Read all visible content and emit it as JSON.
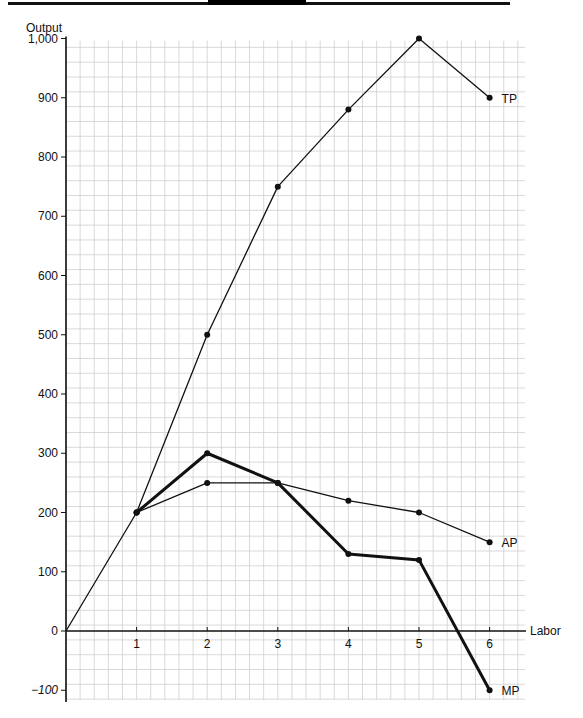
{
  "chart_data": {
    "type": "line",
    "title": "",
    "xlabel": "Labor",
    "ylabel": "Output",
    "x": [
      0,
      1,
      2,
      3,
      4,
      5,
      6
    ],
    "x_ticks": [
      "1",
      "2",
      "3",
      "4",
      "5",
      "6"
    ],
    "y_ticks": [
      "−100",
      "0",
      "100",
      "200",
      "300",
      "400",
      "500",
      "600",
      "700",
      "800",
      "900",
      "1,000"
    ],
    "y_tick_values": [
      -100,
      0,
      100,
      200,
      300,
      400,
      500,
      600,
      700,
      800,
      900,
      1000
    ],
    "xlim": [
      0,
      6.5
    ],
    "ylim": [
      -100,
      1000
    ],
    "grid": true,
    "legend": "inline labels at line ends",
    "series": [
      {
        "name": "TP",
        "label": "TP",
        "x": [
          0,
          1,
          2,
          3,
          4,
          5,
          6
        ],
        "values": [
          0,
          200,
          500,
          750,
          880,
          1000,
          900
        ],
        "weight": "thin"
      },
      {
        "name": "AP",
        "label": "AP",
        "x": [
          1,
          2,
          3,
          4,
          5,
          6
        ],
        "values": [
          200,
          250,
          250,
          220,
          200,
          150
        ],
        "weight": "thin"
      },
      {
        "name": "MP",
        "label": "MP",
        "x": [
          1,
          2,
          3,
          4,
          5,
          6
        ],
        "values": [
          200,
          300,
          250,
          130,
          120,
          -100
        ],
        "weight": "thick"
      }
    ]
  },
  "header_bar": {
    "visible": true
  }
}
